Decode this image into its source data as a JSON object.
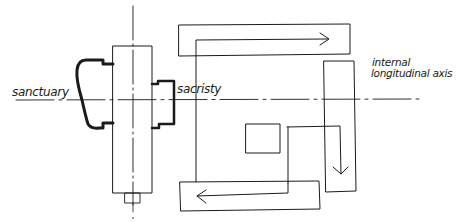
{
  "diagram": {
    "type": "architectural plan sketch",
    "colors": {
      "ink": "#1a1a1a",
      "background": "#ffffff"
    },
    "labels": {
      "sanctuary": "sanctuary",
      "sacristy": "sacristy",
      "axis_line1": "internal",
      "axis_line2": "longitudinal axis"
    },
    "elements": [
      {
        "name": "transverse-axis",
        "kind": "dash-dot line",
        "orientation": "vertical"
      },
      {
        "name": "longitudinal-axis",
        "kind": "dash-dot line",
        "orientation": "horizontal"
      },
      {
        "name": "central-nave",
        "kind": "rectangle"
      },
      {
        "name": "sanctuary-apse",
        "kind": "thick outline"
      },
      {
        "name": "sacristy-block",
        "kind": "thick outline"
      },
      {
        "name": "top-circulation-band",
        "kind": "rectangle with right arrow"
      },
      {
        "name": "right-circulation-band",
        "kind": "rectangle with down arrow"
      },
      {
        "name": "bottom-circulation-band",
        "kind": "rectangle with left arrow"
      },
      {
        "name": "central-courtyard",
        "kind": "square"
      }
    ]
  }
}
